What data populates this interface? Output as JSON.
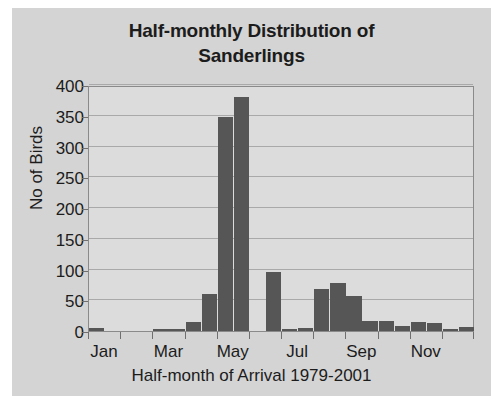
{
  "chart_data": {
    "type": "bar",
    "title": "Half-monthly Distribution of Sanderlings",
    "title_lines": [
      "Half-monthly Distribution of",
      "Sanderlings"
    ],
    "xlabel": "Half-month of Arrival 1979-2001",
    "ylabel": "No of Birds",
    "ylim": [
      0,
      400
    ],
    "yticks": [
      0,
      50,
      100,
      150,
      200,
      250,
      300,
      350,
      400
    ],
    "ytick_labels": [
      "0",
      "50",
      "100",
      "150",
      "200",
      "250",
      "300",
      "350",
      "400"
    ],
    "grid": true,
    "legend": "none",
    "bar_color": "#565656",
    "plot_background": "#dcdcdc",
    "panel_background": "#d4d4d4",
    "categories": [
      "Jan-1",
      "Jan-2",
      "Feb-1",
      "Feb-2",
      "Mar-1",
      "Mar-2",
      "Apr-1",
      "Apr-2",
      "May-1",
      "May-2",
      "Jun-1",
      "Jun-2",
      "Jul-1",
      "Jul-2",
      "Aug-1",
      "Aug-2",
      "Sep-1",
      "Sep-2",
      "Oct-1",
      "Oct-2",
      "Nov-1",
      "Nov-2",
      "Dec-1",
      "Dec-2"
    ],
    "values": [
      5,
      0,
      0,
      0,
      4,
      4,
      15,
      60,
      348,
      380,
      0,
      96,
      2,
      5,
      68,
      78,
      57,
      17,
      16,
      8,
      14,
      13,
      2,
      6
    ],
    "xtick_labels": [
      "Jan",
      "Mar",
      "May",
      "Jul",
      "Sep",
      "Nov"
    ],
    "xtick_positions": [
      0,
      4,
      8,
      12,
      16,
      20
    ]
  }
}
